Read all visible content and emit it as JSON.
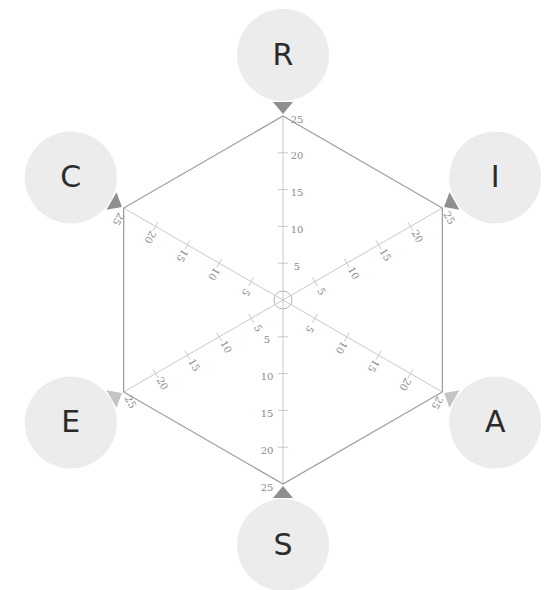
{
  "chart_data": {
    "type": "radar",
    "title": "",
    "axes": [
      "R",
      "I",
      "A",
      "S",
      "E",
      "C"
    ],
    "axis_range": [
      0,
      25
    ],
    "tick_values": [
      5,
      10,
      15,
      20,
      25
    ],
    "tick_labels": [
      "5",
      "10",
      "15",
      "20",
      "25"
    ],
    "grid": false,
    "series": [],
    "colors": {
      "axis_line": "#c8c8c8",
      "hexagon_outline": "#9a9a9a",
      "node_fill": "#ececec",
      "node_pointer": "#8f8f8f",
      "node_pointer_light": "#c4c4c4",
      "label_text": "#2b2b2b",
      "tick_text": "#8a8a8a"
    }
  }
}
